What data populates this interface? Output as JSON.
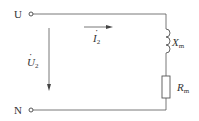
{
  "terminals": {
    "top": "U",
    "bottom": "N"
  },
  "voltage": {
    "symbol": "U",
    "subscript": "2"
  },
  "current": {
    "symbol": "I",
    "subscript": "2"
  },
  "components": {
    "inductor": {
      "symbol": "X",
      "subscript": "m"
    },
    "resistor": {
      "symbol": "R",
      "subscript": "m"
    }
  },
  "colors": {
    "wire": "#555555",
    "text": "#333333"
  }
}
